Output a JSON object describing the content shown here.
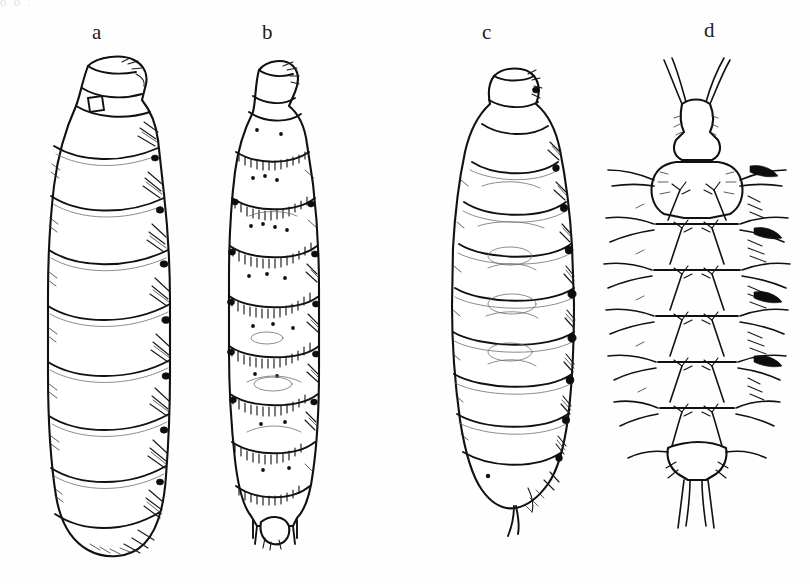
{
  "plate": {
    "width": 810,
    "height": 584,
    "background_color": "#fefefe",
    "ink_color": "#111111",
    "top_bleed_text": "o o                                                                  .",
    "caption": ""
  },
  "labels": [
    {
      "id": "a",
      "text": "a",
      "x": 92,
      "y": 22
    },
    {
      "id": "b",
      "text": "b",
      "x": 262,
      "y": 22
    },
    {
      "id": "c",
      "text": "c",
      "x": 482,
      "y": 22
    },
    {
      "id": "d",
      "text": "d",
      "x": 704,
      "y": 20
    }
  ],
  "figures": [
    {
      "id": "a",
      "name": "larva-a",
      "label": "a",
      "description": "Smooth cylindrical muscoid maggot, tapering anteriorly, heavy oblique shading along right margin, blunt rounded posterior",
      "segment_count": 11,
      "surface": "smooth",
      "left": 18,
      "top": 44,
      "width": 180,
      "height": 520
    },
    {
      "id": "b",
      "name": "larva-b",
      "label": "b",
      "description": "Segmented larva with encircling bands of fine spinules at each intersegmental border, scattered dark setal punctures, small terminal processes",
      "segment_count": 12,
      "surface": "spinulose-banded",
      "left": 205,
      "top": 52,
      "width": 130,
      "height": 498
    },
    {
      "id": "c",
      "name": "larva-c",
      "label": "c",
      "description": "Plump fusiform larva, broadest at mid-body, smooth integument with a row of dark round lateral tubercles and a small terminal spine",
      "segment_count": 12,
      "surface": "smooth-tuberculate",
      "left": 432,
      "top": 56,
      "width": 150,
      "height": 480
    },
    {
      "id": "d",
      "name": "larva-d",
      "label": "d",
      "description": "Dorsoventral view of larva bearing long branched lateral processes, a pair of divergent anterior horns and paired terminal spines",
      "segment_count": 9,
      "surface": "spinose-processes",
      "left": 598,
      "top": 44,
      "width": 190,
      "height": 480
    }
  ]
}
